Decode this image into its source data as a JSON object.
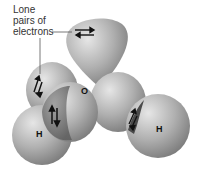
{
  "diagram": {
    "callout": {
      "lines": [
        "Lone",
        "pairs of",
        "electrons"
      ]
    },
    "atoms": {
      "oxygen": "O",
      "hydrogen_left": "H",
      "hydrogen_right": "H"
    },
    "electron_pair_symbols": [
      "⇄",
      "⇅",
      "⇅",
      "⇅"
    ],
    "colors": {
      "lobe_light": "#d8d8d8",
      "lobe_mid": "#a8a8a8",
      "lobe_dark": "#7a7a7a",
      "overlap": "#6e6e6e"
    }
  }
}
